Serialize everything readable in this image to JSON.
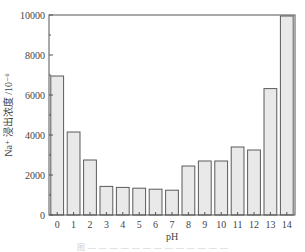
{
  "chart_data": {
    "type": "bar",
    "title": "",
    "xlabel": "pH",
    "ylabel": "Na⁺ 浸出浓度 /10⁻⁶",
    "categories": [
      "0",
      "1",
      "2",
      "3",
      "4",
      "5",
      "6",
      "7",
      "8",
      "9",
      "10",
      "11",
      "12",
      "13",
      "14"
    ],
    "values": [
      6950,
      4150,
      2750,
      1430,
      1380,
      1340,
      1290,
      1240,
      2450,
      2700,
      2700,
      3400,
      3250,
      6320,
      9950
    ],
    "ylim": [
      0,
      10000
    ],
    "yticks": [
      0,
      2000,
      4000,
      6000,
      8000,
      10000
    ],
    "ytick_labels": [
      "0",
      "2000",
      "4000",
      "6000",
      "8000",
      "10000"
    ],
    "minor_ytick_step": 1000,
    "grid": false,
    "legend": null,
    "bar_fill": "#e9e9e9",
    "bar_edge": "#5a5a5a",
    "axis_color": "#555555"
  },
  "caption": {
    "text": "图 — — — — — — — — — — — — —",
    "legible": false
  }
}
